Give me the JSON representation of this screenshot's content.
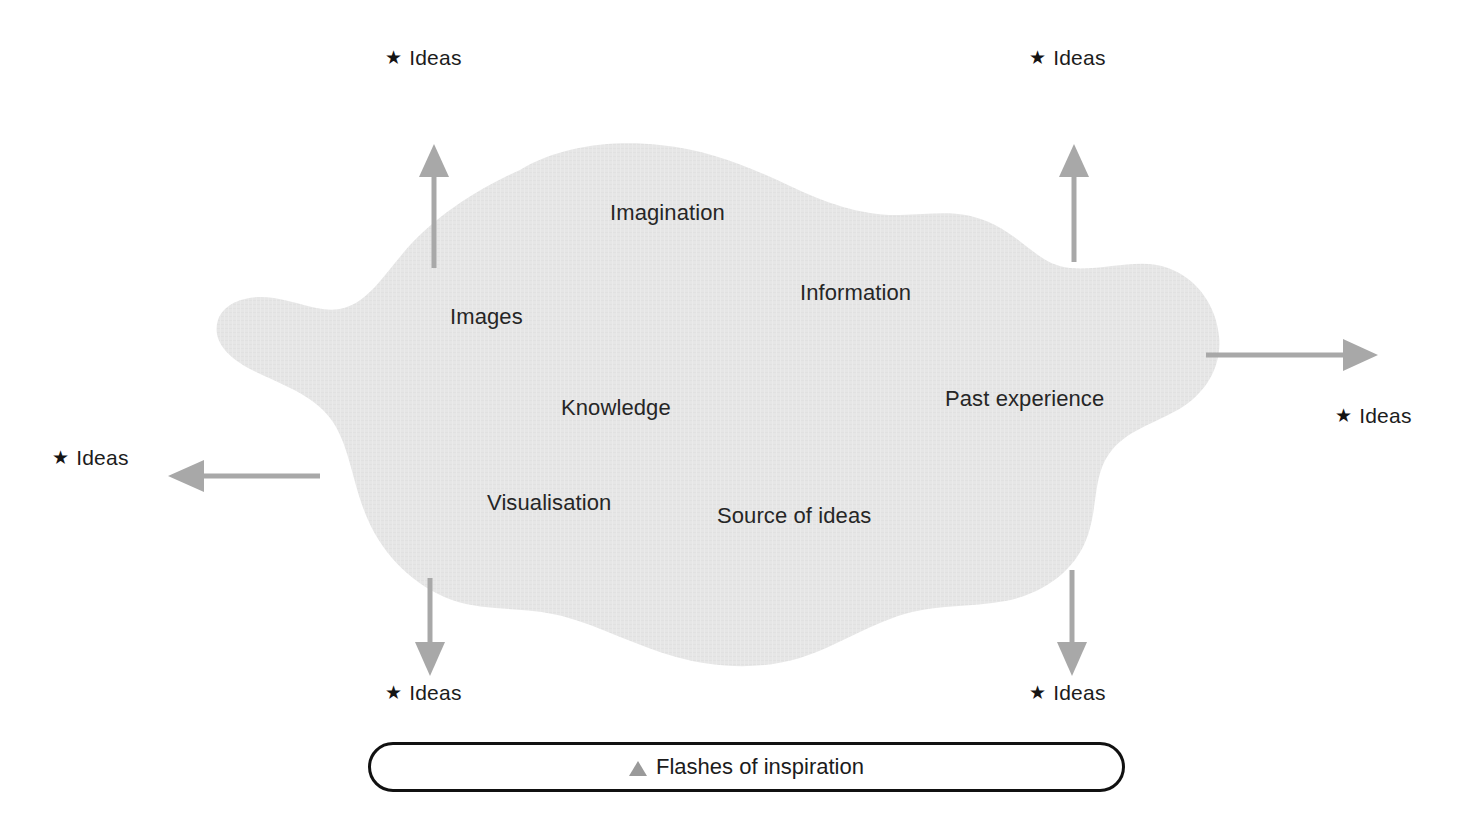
{
  "figure": {
    "type": "concept-diagram",
    "background_color": "#ffffff",
    "cloud": {
      "name": "source-of-ideas-cloud",
      "fill_color": "#e6e6e6",
      "labels": [
        {
          "id": "imagination",
          "text": "Imagination",
          "x": 610,
          "y": 200
        },
        {
          "id": "images",
          "text": "Images",
          "x": 450,
          "y": 304
        },
        {
          "id": "information",
          "text": "Information",
          "x": 800,
          "y": 280
        },
        {
          "id": "knowledge",
          "text": "Knowledge",
          "x": 561,
          "y": 395
        },
        {
          "id": "past-experience",
          "text": "Past experience",
          "x": 945,
          "y": 386
        },
        {
          "id": "visualisation",
          "text": "Visualisation",
          "x": 487,
          "y": 490
        },
        {
          "id": "source-of-ideas",
          "text": "Source of ideas",
          "x": 717,
          "y": 503
        }
      ]
    },
    "arrows": {
      "color": "#a8a8a8",
      "items": [
        {
          "id": "arrow-up-left",
          "direction": "up"
        },
        {
          "id": "arrow-up-right",
          "direction": "up"
        },
        {
          "id": "arrow-right",
          "direction": "right"
        },
        {
          "id": "arrow-left",
          "direction": "left"
        },
        {
          "id": "arrow-down-left",
          "direction": "down"
        },
        {
          "id": "arrow-down-right",
          "direction": "down"
        }
      ]
    },
    "ideas_labels": [
      {
        "id": "ideas-top-left",
        "star": "★",
        "text": "Ideas",
        "x": 385,
        "y": 46
      },
      {
        "id": "ideas-top-right",
        "star": "★",
        "text": "Ideas",
        "x": 1029,
        "y": 46
      },
      {
        "id": "ideas-right",
        "star": "★",
        "text": "Ideas",
        "x": 1335,
        "y": 404
      },
      {
        "id": "ideas-left",
        "star": "★",
        "text": "Ideas",
        "x": 52,
        "y": 446
      },
      {
        "id": "ideas-bottom-left",
        "star": "★",
        "text": "Ideas",
        "x": 385,
        "y": 681
      },
      {
        "id": "ideas-bottom-right",
        "star": "★",
        "text": "Ideas",
        "x": 1029,
        "y": 681
      }
    ],
    "legend": {
      "id": "flashes-of-inspiration-legend",
      "marker": "triangle",
      "marker_color": "#9a9a9a",
      "text": "Flashes of inspiration",
      "border_color": "#111111"
    }
  }
}
